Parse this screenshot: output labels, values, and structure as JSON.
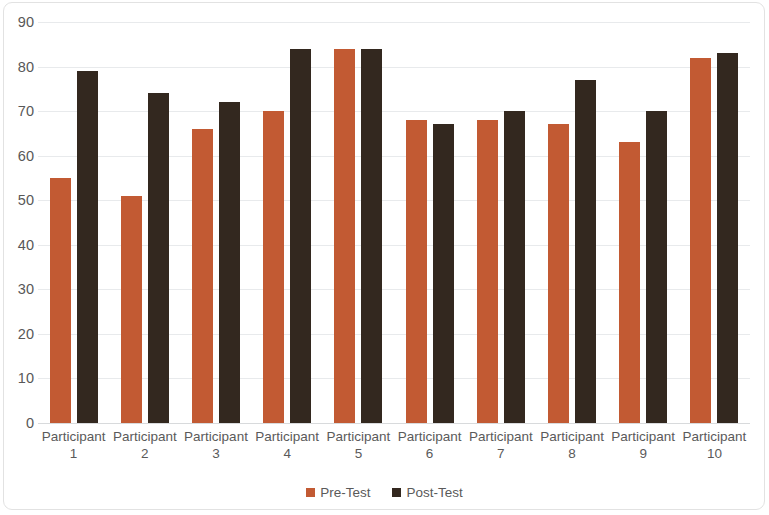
{
  "chart_data": {
    "type": "bar",
    "title": "",
    "subtitle": "",
    "xlabel": "",
    "ylabel": "",
    "ylim": [
      0,
      90
    ],
    "ytick_step": 10,
    "yticks": [
      90,
      80,
      70,
      60,
      50,
      40,
      30,
      20,
      10,
      0
    ],
    "grid": true,
    "legend_position": "bottom",
    "categories": [
      "Participant 1",
      "Participant 2",
      "Participant 3",
      "Participant 4",
      "Participant 5",
      "Participant 6",
      "Participant 7",
      "Participant 8",
      "Participant 9",
      "Participant 10"
    ],
    "category_lines": [
      [
        "Participant",
        "1"
      ],
      [
        "Participant",
        "2"
      ],
      [
        "Participant",
        "3"
      ],
      [
        "Participant",
        "4"
      ],
      [
        "Participant",
        "5"
      ],
      [
        "Participant",
        "6"
      ],
      [
        "Participant",
        "7"
      ],
      [
        "Participant",
        "8"
      ],
      [
        "Participant",
        "9"
      ],
      [
        "Participant",
        "10"
      ]
    ],
    "series": [
      {
        "name": "Pre-Test",
        "color": "#c25a33",
        "values": [
          55,
          51,
          66,
          70,
          84,
          68,
          68,
          67,
          63,
          82
        ]
      },
      {
        "name": "Post-Test",
        "color": "#33281f",
        "values": [
          79,
          74,
          72,
          84,
          84,
          67,
          70,
          77,
          70,
          83
        ]
      }
    ]
  },
  "legend": {
    "items": [
      {
        "label": "Pre-Test",
        "color": "#c25a33"
      },
      {
        "label": "Post-Test",
        "color": "#33281f"
      }
    ]
  },
  "colors": {
    "pre_test": "#c25a33",
    "post_test": "#33281f",
    "gridline": "#e8eaec",
    "tick_text": "#585858",
    "background": "#ffffff"
  }
}
